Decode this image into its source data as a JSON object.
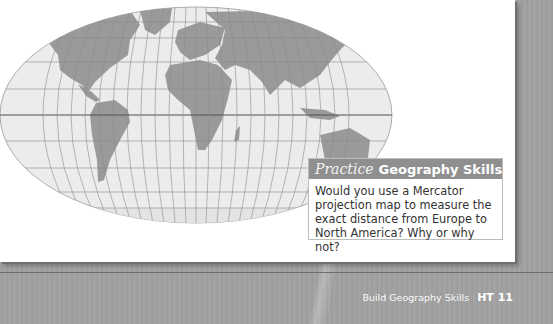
{
  "map": {
    "type": "world-map",
    "projection": "robinson-style oval",
    "colors": {
      "ocean": "#ececec",
      "land": "#9a9a9a",
      "grid": "#8c8c8c",
      "equator": "#4f4f4f"
    }
  },
  "practice": {
    "label_italic": "Practice",
    "label_bold": "Geography Skills",
    "question": "Would you use a Mercator projection map to measure the exact distance from Europe to North America? Why or why not?",
    "header_color": "#8f8f8f"
  },
  "footer": {
    "section_title": "Build Geography Skills",
    "page_number": "HT 11"
  }
}
